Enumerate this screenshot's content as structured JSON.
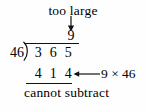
{
  "figure": {
    "kind": "long-division-worksheet",
    "background_color": "#fefefe",
    "ink_color": "#000000"
  },
  "annotations": {
    "top_label": "too large",
    "down_arrow_icon": "arrow-down-icon",
    "product_arrow_icon": "arrow-left-icon",
    "product_note": "9 × 46",
    "bottom_label": "cannot subtract"
  },
  "division": {
    "quotient": "9",
    "divisor": "46",
    "bracket_icon": "division-bracket-icon",
    "dividend_digits": [
      "3",
      "6",
      "5"
    ],
    "product_digits": [
      "4",
      "1",
      "4"
    ]
  }
}
